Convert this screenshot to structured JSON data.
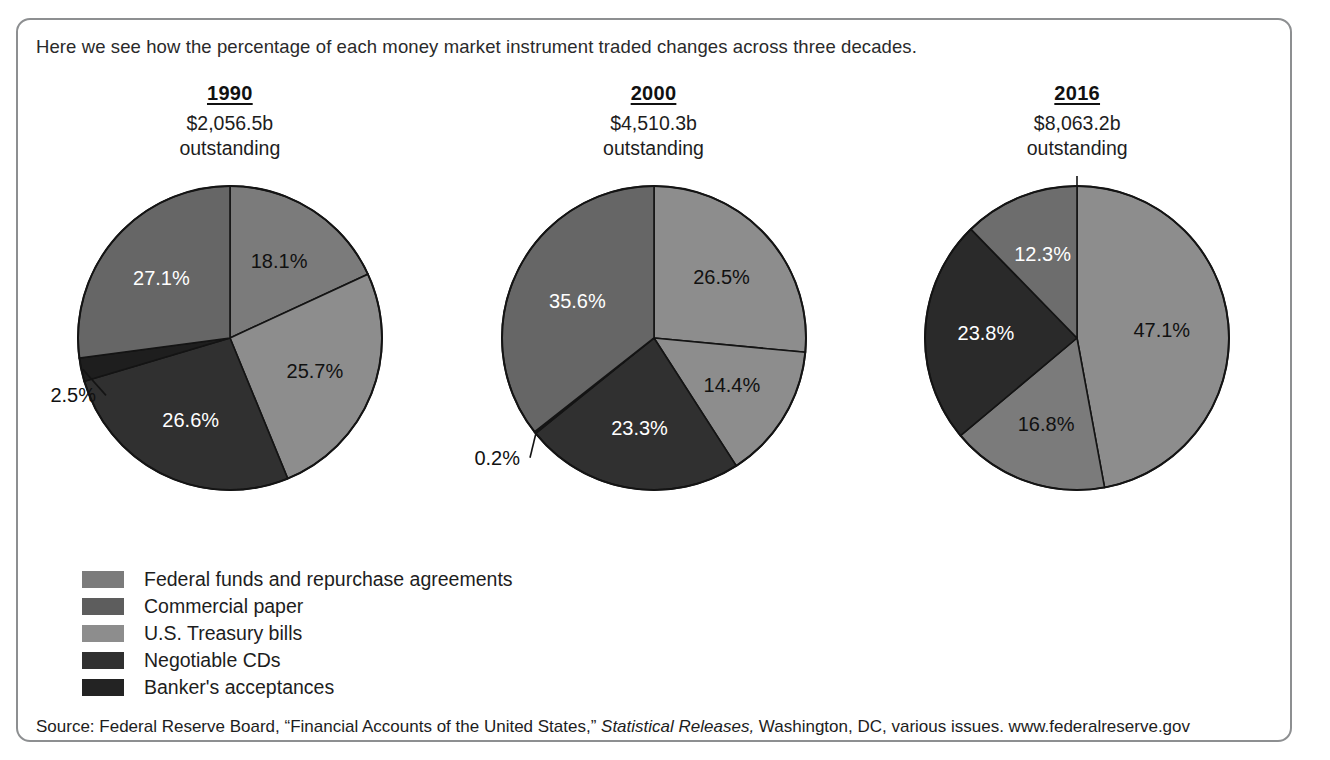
{
  "top_remnant": "Money Market Instruments Outstanding",
  "intro_text": "Here we see how the percentage of each money market instrument traded changes across three decades.",
  "source": {
    "prefix": "Source: Federal Reserve Board, “Financial Accounts of the United States,” ",
    "italic": "Statistical Releases,",
    "suffix": " Washington, DC, various issues. www.federalreserve.gov"
  },
  "legend": {
    "items": [
      {
        "label": "Federal funds and repurchase agreements",
        "color": "#7b7b7b"
      },
      {
        "label": "Commercial paper",
        "color": "#5d5d5d"
      },
      {
        "label": "U.S. Treasury bills",
        "color": "#8d8d8d"
      },
      {
        "label": "Negotiable CDs",
        "color": "#303030"
      },
      {
        "label": "Banker's acceptances",
        "color": "#232323"
      }
    ]
  },
  "chart_data": [
    {
      "type": "pie",
      "title": "1990",
      "subtitle_amount": "$2,056.5b",
      "subtitle_note": "outstanding",
      "categories": [
        "Federal funds and repurchase agreements",
        "U.S. Treasury bills",
        "Negotiable CDs",
        "Banker's acceptances",
        "Commercial paper"
      ],
      "values": [
        18.1,
        25.7,
        26.6,
        2.5,
        27.1
      ],
      "labels": [
        "18.1%",
        "25.7%",
        "26.6%",
        "2.5%",
        "27.1%"
      ],
      "colors": [
        "#7b7b7b",
        "#8d8d8d",
        "#303030",
        "#1e1e1e",
        "#666666"
      ],
      "label_styles": [
        "dark",
        "dark",
        "light",
        "callout",
        "light"
      ],
      "ylabel": "",
      "xlabel": ""
    },
    {
      "type": "pie",
      "title": "2000",
      "subtitle_amount": "$4,510.3b",
      "subtitle_note": "outstanding",
      "categories": [
        "Federal funds and repurchase agreements",
        "U.S. Treasury bills",
        "Negotiable CDs",
        "Banker's acceptances",
        "Commercial paper"
      ],
      "values": [
        26.5,
        14.4,
        23.3,
        0.2,
        35.6
      ],
      "labels": [
        "26.5%",
        "14.4%",
        "23.3%",
        "0.2%",
        "35.6%"
      ],
      "colors": [
        "#8d8d8d",
        "#8d8d8d",
        "#303030",
        "#1e1e1e",
        "#666666"
      ],
      "label_styles": [
        "dark",
        "dark",
        "light",
        "callout",
        "light"
      ],
      "ylabel": "",
      "xlabel": ""
    },
    {
      "type": "pie",
      "title": "2016",
      "subtitle_amount": "$8,063.2b",
      "subtitle_note": "outstanding",
      "categories": [
        "Federal funds and repurchase agreements",
        "U.S. Treasury bills",
        "Negotiable CDs",
        "Banker's acceptances",
        "Commercial paper"
      ],
      "values": [
        47.1,
        16.8,
        23.8,
        0.0,
        12.3
      ],
      "labels": [
        "47.1%",
        "16.8%",
        "23.8%",
        "0%",
        "12.3%"
      ],
      "colors": [
        "#8d8d8d",
        "#7b7b7b",
        "#2a2a2a",
        "#1e1e1e",
        "#6d6d6d"
      ],
      "label_styles": [
        "dark",
        "dark",
        "light",
        "callout",
        "light"
      ],
      "ylabel": "",
      "xlabel": ""
    }
  ]
}
